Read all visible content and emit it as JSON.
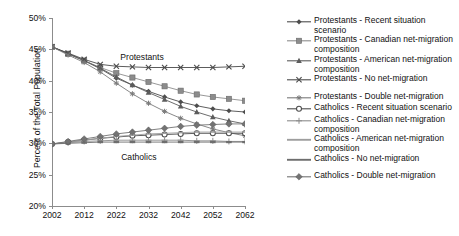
{
  "chart_data": {
    "type": "line",
    "title": "",
    "xlabel": "",
    "ylabel": "Percent of the Total Population",
    "xlim": [
      2002,
      2062
    ],
    "ylim": [
      0.2,
      0.5
    ],
    "ytick_labels": [
      "50%",
      "45%",
      "40%",
      "35%",
      "30%",
      "25%",
      "20%"
    ],
    "ytick_values": [
      0.5,
      0.45,
      0.4,
      0.35,
      0.3,
      0.25,
      0.2
    ],
    "xtick_labels": [
      "2002",
      "2012",
      "2022",
      "2032",
      "2042",
      "2052",
      "2062"
    ],
    "xtick_values": [
      2002,
      2012,
      2022,
      2032,
      2042,
      2052,
      2062
    ],
    "grid": false,
    "legend_position": "right",
    "annotations": [
      {
        "text": "Protestants",
        "x": 2030,
        "y": 0.437
      },
      {
        "text": "Catholics",
        "x": 2029,
        "y": 0.278
      }
    ],
    "x": [
      2002,
      2007,
      2012,
      2017,
      2022,
      2027,
      2032,
      2037,
      2042,
      2047,
      2052,
      2057,
      2062
    ],
    "series": [
      {
        "name": "Protestants - Recent situation scenario",
        "marker": "diamond-filled",
        "color": "#4d4d4d",
        "values": [
          0.454,
          0.443,
          0.432,
          0.419,
          0.404,
          0.393,
          0.383,
          0.374,
          0.366,
          0.36,
          0.355,
          0.352,
          0.35
        ]
      },
      {
        "name": "Protestants - Canadian net-migration composition",
        "marker": "square-filled",
        "color": "#8c8c8c",
        "values": [
          0.454,
          0.443,
          0.432,
          0.421,
          0.412,
          0.405,
          0.398,
          0.391,
          0.384,
          0.378,
          0.374,
          0.371,
          0.368
        ]
      },
      {
        "name": "Protestants - American net-migration composition",
        "marker": "triangle-filled",
        "color": "#5c5c5c",
        "values": [
          0.454,
          0.443,
          0.432,
          0.42,
          0.406,
          0.393,
          0.381,
          0.37,
          0.359,
          0.35,
          0.342,
          0.336,
          0.331
        ]
      },
      {
        "name": "Protestants - No net-migration",
        "marker": "cross-x",
        "color": "#4a4a4a",
        "values": [
          0.454,
          0.444,
          0.434,
          0.426,
          0.423,
          0.422,
          0.421,
          0.421,
          0.421,
          0.421,
          0.421,
          0.422,
          0.423
        ]
      },
      {
        "name": "Protestants - Double net-migration",
        "marker": "asterisk",
        "color": "#7a7a7a",
        "values": [
          0.454,
          0.441,
          0.429,
          0.414,
          0.396,
          0.379,
          0.364,
          0.351,
          0.34,
          0.331,
          0.323,
          0.317,
          0.312
        ]
      },
      {
        "name": "Catholics - Recent situation scenario",
        "marker": "circle-open",
        "color": "#4d4d4d",
        "values": [
          0.299,
          0.302,
          0.305,
          0.308,
          0.31,
          0.312,
          0.313,
          0.314,
          0.315,
          0.316,
          0.316,
          0.316,
          0.316
        ]
      },
      {
        "name": "Catholics - Canadian net-migration composition",
        "marker": "plus",
        "color": "#8c8c8c",
        "values": [
          0.299,
          0.301,
          0.303,
          0.304,
          0.305,
          0.305,
          0.305,
          0.305,
          0.305,
          0.304,
          0.304,
          0.303,
          0.303
        ]
      },
      {
        "name": "Catholics - American net-migration composition",
        "marker": "dash",
        "color": "#9e9e9e",
        "values": [
          0.299,
          0.302,
          0.305,
          0.308,
          0.311,
          0.313,
          0.315,
          0.316,
          0.317,
          0.318,
          0.318,
          0.318,
          0.318
        ]
      },
      {
        "name": "Catholics - No net-migration",
        "marker": "dash-thick",
        "color": "#6e6e6e",
        "values": [
          0.299,
          0.3,
          0.301,
          0.302,
          0.302,
          0.302,
          0.302,
          0.302,
          0.302,
          0.302,
          0.302,
          0.302,
          0.302
        ]
      },
      {
        "name": "Catholics - Double net-migration",
        "marker": "diamond-large",
        "color": "#737373",
        "values": [
          0.299,
          0.303,
          0.307,
          0.311,
          0.315,
          0.318,
          0.321,
          0.324,
          0.327,
          0.329,
          0.33,
          0.331,
          0.331
        ]
      }
    ]
  },
  "legend": {
    "entries": [
      {
        "label": "Protestants - Recent situation scenario",
        "marker": "diamond-filled"
      },
      {
        "label": "Protestants - Canadian net-migration composition",
        "marker": "square-filled"
      },
      {
        "label": "Protestants - American net-migration composition",
        "marker": "triangle-filled"
      },
      {
        "label": "Protestants - No net-migration",
        "marker": "cross-x"
      },
      {
        "label": "Protestants - Double net-migration",
        "marker": "asterisk"
      },
      {
        "label": "Catholics - Recent situation scenario",
        "marker": "circle-open"
      },
      {
        "label": "Catholics - Canadian net-migration composition",
        "marker": "plus"
      },
      {
        "label": "Catholics - American net-migration composition",
        "marker": "dash"
      },
      {
        "label": "Catholics - No net-migration",
        "marker": "dash-thick"
      },
      {
        "label": "Catholics - Double net-migration",
        "marker": "diamond-large"
      }
    ]
  }
}
